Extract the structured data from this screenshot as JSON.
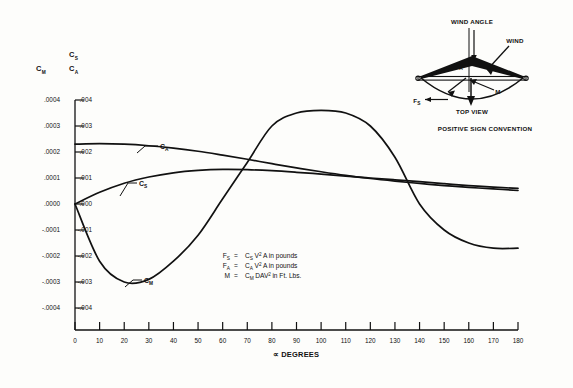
{
  "chart_data": {
    "type": "line",
    "title": "",
    "xlabel": "∀ DEGREES",
    "xlabel_display": "∝ DEGREES",
    "xlim": [
      0,
      180
    ],
    "xticks": [
      0,
      10,
      20,
      30,
      40,
      50,
      60,
      70,
      80,
      90,
      100,
      110,
      120,
      130,
      140,
      150,
      160,
      170,
      180
    ],
    "xticklabels": [
      "0",
      "10",
      "20",
      "30",
      "40",
      "50",
      "60",
      "70",
      "80",
      "90",
      "100",
      "110",
      "120",
      "130",
      "140",
      "150",
      "160",
      "170",
      "180"
    ],
    "grid": false,
    "legend_position": "inline-curve-labels",
    "axes": [
      {
        "id": "left-outer",
        "header_main": "C",
        "header_sub": "M",
        "ylim": [
          -0.0004,
          0.0004
        ],
        "yticks": [
          0.0004,
          0.0003,
          0.0002,
          0.0001,
          0.0,
          -0.0001,
          -0.0002,
          -0.0003,
          -0.0004
        ],
        "yticklabels": [
          ".0004",
          ".0003",
          ".0002",
          ".0001",
          ".0000",
          "-.0001",
          "-.0002",
          "-.0003",
          "-.0004"
        ]
      },
      {
        "id": "left-inner",
        "header_main": "C",
        "header_sub": "S",
        "header2_main": "C",
        "header2_sub": "A",
        "ylim": [
          -0.004,
          0.004
        ],
        "yticks": [
          0.004,
          0.003,
          0.002,
          0.001,
          0.0,
          -0.001,
          -0.002,
          -0.003,
          -0.004
        ],
        "yticklabels": [
          ".004",
          ".003",
          ".002",
          ".001",
          ".000",
          "-.001",
          "-.002",
          "-.003",
          "-.004"
        ]
      }
    ],
    "series": [
      {
        "name": "C_A",
        "label_main": "C",
        "label_sub": "A",
        "axis": "left-inner",
        "x": [
          0,
          10,
          20,
          30,
          40,
          50,
          60,
          70,
          80,
          90,
          100,
          110,
          120,
          130,
          140,
          150,
          160,
          170,
          180
        ],
        "values": [
          0.0023,
          0.00232,
          0.0023,
          0.00224,
          0.00215,
          0.00203,
          0.00188,
          0.00172,
          0.00155,
          0.00139,
          0.00124,
          0.0011,
          0.00098,
          0.00088,
          0.00079,
          0.00071,
          0.00064,
          0.00058,
          0.00052
        ]
      },
      {
        "name": "C_S",
        "label_main": "C",
        "label_sub": "S",
        "axis": "left-inner",
        "x": [
          0,
          10,
          20,
          30,
          40,
          50,
          60,
          70,
          80,
          90,
          100,
          110,
          120,
          130,
          140,
          150,
          160,
          170,
          180
        ],
        "values": [
          0.0,
          0.00045,
          0.0008,
          0.00104,
          0.0012,
          0.00129,
          0.00133,
          0.00132,
          0.00128,
          0.00122,
          0.00115,
          0.00107,
          0.001,
          0.00093,
          0.00086,
          0.00078,
          0.00071,
          0.00065,
          0.0006
        ]
      },
      {
        "name": "C_M",
        "label_main": "C",
        "label_sub": "M",
        "axis": "left-outer",
        "x": [
          0,
          10,
          20,
          30,
          40,
          50,
          60,
          70,
          80,
          90,
          100,
          110,
          120,
          130,
          140,
          150,
          160,
          170,
          180
        ],
        "values": [
          0.0,
          -0.00022,
          -0.0003,
          -0.00029,
          -0.00022,
          -0.00012,
          2e-05,
          0.00016,
          0.0003,
          0.00035,
          0.00036,
          0.00035,
          0.0003,
          0.00018,
          0.0,
          -0.0001,
          -0.00015,
          -0.00017,
          -0.00017
        ]
      }
    ],
    "annotations": {
      "equations": [
        {
          "lhs_main": "F",
          "lhs_sub": "S",
          "eq": "=",
          "rhs_main": "C",
          "rhs_sub": "S",
          "rhs_rest": "V",
          "rhs_sup": "2",
          "rhs_tail": "A in pounds"
        },
        {
          "lhs_main": "F",
          "lhs_sub": "A",
          "eq": "=",
          "rhs_main": "C",
          "rhs_sub": "A",
          "rhs_rest": "V",
          "rhs_sup": "2",
          "rhs_tail": "A in pounds"
        },
        {
          "lhs_main": "M",
          "lhs_sub": "",
          "eq": "=",
          "rhs_main": "C",
          "rhs_sub": "M",
          "rhs_rest": "DAV",
          "rhs_sup": "2",
          "rhs_tail": "in Ft. Lbs."
        }
      ]
    }
  },
  "diagram": {
    "caption": "POSITIVE SIGN CONVENTION",
    "view_label": "TOP VIEW",
    "wind_angle_label": "WIND ANGLE",
    "wind_label": "WIND",
    "alpha_label": "∝",
    "force_axial": {
      "main": "F",
      "sub": "A"
    },
    "force_side": {
      "main": "F",
      "sub": "S"
    },
    "moment_label": "M"
  }
}
